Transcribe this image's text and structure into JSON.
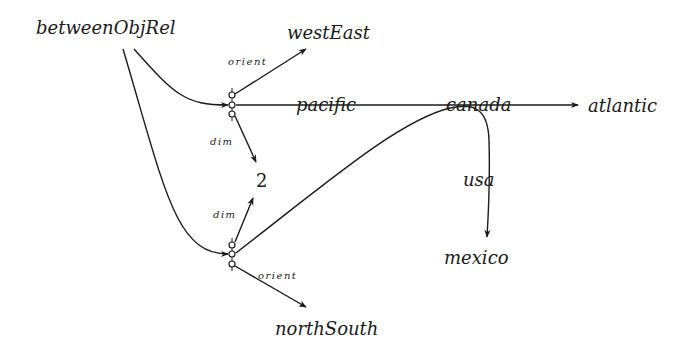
{
  "diagram": {
    "type": "semantic-relation-graph",
    "nodes": {
      "root": "betweenObjRel",
      "west_east": "westEast",
      "pacific": "pacific",
      "atlantic": "atlantic",
      "canada": "canada",
      "two": "2",
      "usa": "usa",
      "mexico": "mexico",
      "north_south": "northSouth"
    },
    "edge_labels": {
      "orient_top": "orient",
      "dim_top": "dim",
      "dim_bottom": "dim",
      "orient_bottom": "orient"
    },
    "edges": [
      {
        "from": "betweenObjRel",
        "to": "relation-node-1"
      },
      {
        "from": "betweenObjRel",
        "to": "relation-node-2"
      },
      {
        "from": "relation-node-1",
        "to": "westEast",
        "label": "orient"
      },
      {
        "from": "relation-node-1",
        "to": "atlantic",
        "via": [
          "pacific",
          "canada"
        ]
      },
      {
        "from": "relation-node-1",
        "to": "2",
        "label": "dim"
      },
      {
        "from": "relation-node-2",
        "to": "2",
        "label": "dim"
      },
      {
        "from": "relation-node-2",
        "to": "mexico",
        "via": [
          "canada",
          "usa"
        ]
      },
      {
        "from": "relation-node-2",
        "to": "northSouth",
        "label": "orient"
      }
    ]
  }
}
